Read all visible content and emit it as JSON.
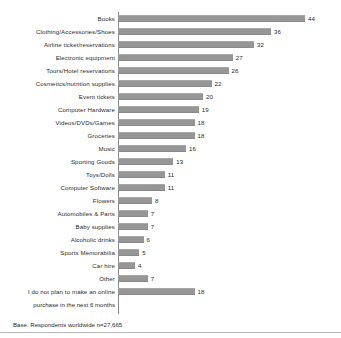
{
  "figure": {
    "base_note": "Base: Respondents worldwide n=27,665",
    "bar_color": "#969696",
    "axis_color": "#8c8c8c",
    "text_color": "#2b2b2b",
    "background": "#ffffff",
    "wrapped_label_line2": "purchase in the next 6 months"
  },
  "chart_data": {
    "type": "bar",
    "orientation": "horizontal",
    "title": "",
    "subtitle": "",
    "xlabel": "",
    "ylabel": "",
    "grid": false,
    "legend": false,
    "xlim": [
      0,
      44
    ],
    "annotations": [
      "Base: Respondents worldwide n=27,665"
    ],
    "categories": [
      "Books",
      "Clothing/Accessories/Shoes",
      "Airline ticket/reservations",
      "Electronic equipment",
      "Tours/Hotel reservations",
      "Cosmetics/nutrition supplies",
      "Event tickets",
      "Computer Hardware",
      "Videos/DVDs/Games",
      "Groceries",
      "Music",
      "Sporting Goods",
      "Toys/Dolls",
      "Computer Software",
      "Flowers",
      "Automobiles & Parts",
      "Baby supplies",
      "Alcoholic drinks",
      "Sports Memorabilia",
      "Car hire",
      "Other",
      "I do not plan to make an online"
    ],
    "values": [
      44,
      36,
      32,
      27,
      26,
      22,
      20,
      19,
      18,
      18,
      16,
      13,
      11,
      11,
      8,
      7,
      7,
      6,
      5,
      4,
      7,
      18
    ],
    "labels": [
      "44",
      "36",
      "32",
      "27",
      "26",
      "22",
      "20",
      "19",
      "18",
      "18",
      "16",
      "13",
      "11",
      "11",
      "8",
      "7",
      "7",
      "6",
      "5",
      "4",
      "7",
      "18"
    ]
  }
}
